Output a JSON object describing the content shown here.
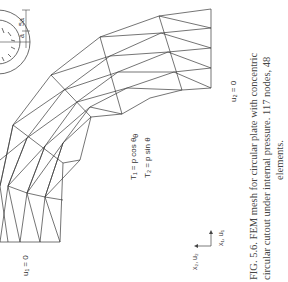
{
  "figure": {
    "caption_line1": "FIG. 5.6.   FEM mesh for circular plate with concentric",
    "caption_line2": "circular cutout under internal pressure. 117 nodes, 48",
    "caption_line3": "elements.",
    "traction_1": "T₁ = p cos θ",
    "traction_2": "T₂ = p sin θ",
    "bc_left": "u₁ = 0",
    "bc_right": "u₂ = 0",
    "axis_x1": "x₁, u₁",
    "axis_x2": "x₂, u₂",
    "inset_dim_a": "a",
    "inset_dim_5a": "5a",
    "theta_label": "θ"
  }
}
